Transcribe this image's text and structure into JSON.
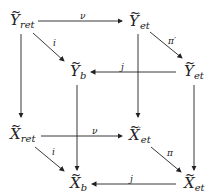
{
  "diagram": {
    "type": "commutative-diagram",
    "nodes": {
      "Y_ret": {
        "base": "Y",
        "sub": "ret",
        "sup": "",
        "tilde": "~"
      },
      "Y_et_prime": {
        "base": "Y",
        "sub": "et",
        "sup": "′",
        "tilde": "~"
      },
      "Y_b": {
        "base": "Y",
        "sub": "b",
        "sup": "",
        "tilde": "~"
      },
      "Y_et": {
        "base": "Y",
        "sub": "et",
        "sup": "",
        "tilde": "~"
      },
      "X_ret": {
        "base": "X",
        "sub": "ret",
        "sup": "",
        "tilde": "~"
      },
      "X_et_prime": {
        "base": "X",
        "sub": "et",
        "sup": "′",
        "tilde": "~"
      },
      "X_b": {
        "base": "X",
        "sub": "b",
        "sup": "",
        "tilde": "~"
      },
      "X_et": {
        "base": "X",
        "sub": "et",
        "sup": "",
        "tilde": "~"
      }
    },
    "labels": {
      "nu_top": "ν",
      "i_top": "i",
      "pi_prime": "π′",
      "j_top": "j",
      "nu_bottom": "ν",
      "i_bottom": "i",
      "pi": "π",
      "j_bottom": "j"
    }
  }
}
